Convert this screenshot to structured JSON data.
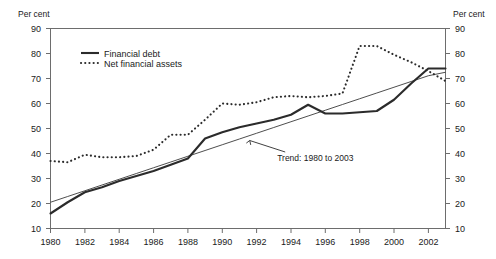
{
  "chart_data": {
    "type": "line",
    "title": "",
    "subtitle": "",
    "xlabel": "",
    "ylabel": "Per cent",
    "ylabel_right": "Per cent",
    "xlim": [
      1980,
      2003
    ],
    "ylim": [
      10,
      90
    ],
    "yticks": [
      10,
      20,
      30,
      40,
      50,
      60,
      70,
      80,
      90
    ],
    "ytick_labels": [
      "10",
      "20",
      "30",
      "40",
      "50",
      "60",
      "70",
      "80",
      "90"
    ],
    "xticks": [
      1980,
      1982,
      1984,
      1986,
      1988,
      1990,
      1992,
      1994,
      1996,
      1998,
      2000,
      2002
    ],
    "xtick_labels": [
      "1980",
      "1982",
      "1984",
      "1986",
      "1988",
      "1990",
      "1992",
      "1994",
      "1996",
      "1998",
      "2000",
      "2002"
    ],
    "grid": false,
    "legend_position": "top-left-inside",
    "x": [
      1980,
      1981,
      1982,
      1983,
      1984,
      1985,
      1986,
      1987,
      1988,
      1989,
      1990,
      1991,
      1992,
      1993,
      1994,
      1995,
      1996,
      1997,
      1998,
      1999,
      2000,
      2001,
      2002,
      2003
    ],
    "series": [
      {
        "name": "Financial debt",
        "style": "solid",
        "color": "#2b2b2b",
        "values": [
          16.0,
          20.5,
          24.5,
          26.5,
          29.0,
          31.0,
          33.0,
          35.5,
          38.0,
          46.0,
          48.5,
          50.5,
          52.0,
          53.5,
          55.5,
          59.5,
          56.0,
          56.0,
          56.5,
          57.0,
          61.5,
          68.0,
          74.0,
          74.0
        ]
      },
      {
        "name": "Net financial assets",
        "style": "dotted",
        "color": "#2b2b2b",
        "values": [
          37.0,
          36.5,
          39.5,
          38.5,
          38.5,
          39.0,
          41.5,
          47.5,
          47.5,
          53.5,
          60.0,
          59.5,
          60.5,
          62.5,
          63.0,
          62.5,
          63.0,
          64.0,
          83.0,
          83.0,
          79.5,
          76.5,
          73.0,
          69.0
        ]
      },
      {
        "name": "Trend: 1980 to 2003",
        "style": "thin-solid",
        "color": "#3a3a3a",
        "values": [
          20.5,
          22.8,
          25.1,
          27.4,
          29.7,
          32.0,
          34.3,
          36.6,
          38.9,
          41.2,
          43.5,
          45.8,
          48.1,
          50.4,
          52.7,
          55.0,
          57.3,
          59.6,
          61.9,
          64.2,
          66.5,
          68.8,
          71.1,
          72.5
        ]
      }
    ],
    "annotations": [
      {
        "text": "Trend: 1980 to 2003",
        "x": 1993.2,
        "y": 37.0,
        "points_to_x": 1991.6,
        "points_to_y": 45.2
      }
    ]
  },
  "legend": {
    "items": [
      {
        "label": "Financial debt",
        "style": "solid"
      },
      {
        "label": "Net financial assets",
        "style": "dotted"
      }
    ]
  },
  "axes": {
    "left_unit": "Per cent",
    "right_unit": "Per cent"
  }
}
